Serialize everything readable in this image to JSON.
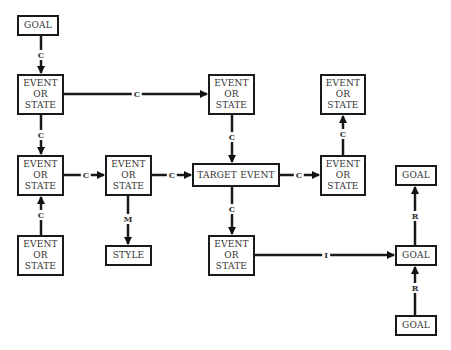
{
  "diagram": {
    "nodes": [
      {
        "id": "goal_top",
        "label": "GOAL",
        "x": 17,
        "y": 15,
        "w": 42,
        "h": 21
      },
      {
        "id": "es_r1_left",
        "label": "EVENT\nOR\nSTATE",
        "x": 17,
        "y": 74,
        "w": 47,
        "h": 41
      },
      {
        "id": "es_r1_mid",
        "label": "EVENT\nOR\nSTATE",
        "x": 208,
        "y": 74,
        "w": 47,
        "h": 41
      },
      {
        "id": "es_r1_right",
        "label": "EVENT\nOR\nSTATE",
        "x": 320,
        "y": 74,
        "w": 46,
        "h": 41
      },
      {
        "id": "es_r2_left",
        "label": "EVENT\nOR\nSTATE",
        "x": 17,
        "y": 155,
        "w": 47,
        "h": 41
      },
      {
        "id": "es_r2_mid",
        "label": "EVENT\nOR\nSTATE",
        "x": 105,
        "y": 155,
        "w": 47,
        "h": 41
      },
      {
        "id": "target_event",
        "label": "TARGET EVENT",
        "x": 192,
        "y": 163,
        "w": 88,
        "h": 24
      },
      {
        "id": "es_r2_right",
        "label": "EVENT\nOR\nSTATE",
        "x": 320,
        "y": 155,
        "w": 46,
        "h": 41
      },
      {
        "id": "goal_r2_right",
        "label": "GOAL",
        "x": 395,
        "y": 165,
        "w": 42,
        "h": 21
      },
      {
        "id": "es_r3_left",
        "label": "EVENT\nOR\nSTATE",
        "x": 17,
        "y": 235,
        "w": 47,
        "h": 41
      },
      {
        "id": "style",
        "label": "STYLE",
        "x": 105,
        "y": 245,
        "w": 47,
        "h": 21
      },
      {
        "id": "es_r3_mid",
        "label": "EVENT\nOR\nSTATE",
        "x": 208,
        "y": 235,
        "w": 47,
        "h": 41
      },
      {
        "id": "goal_r3_right",
        "label": "GOAL",
        "x": 395,
        "y": 245,
        "w": 42,
        "h": 21
      },
      {
        "id": "goal_bottom",
        "label": "GOAL",
        "x": 395,
        "y": 315,
        "w": 42,
        "h": 21
      }
    ],
    "edges": [
      {
        "from": "goal_top",
        "to": "es_r1_left",
        "label": "C",
        "lx": 41,
        "ly": 55
      },
      {
        "from": "es_r1_left",
        "to": "es_r1_mid",
        "label": "C",
        "lx": 137,
        "ly": 94
      },
      {
        "from": "es_r1_left",
        "to": "es_r2_left",
        "label": "C",
        "lx": 41,
        "ly": 135
      },
      {
        "from": "es_r1_mid",
        "to": "target_event",
        "label": "C",
        "lx": 232,
        "ly": 137
      },
      {
        "from": "es_r2_right",
        "to": "es_r1_right",
        "label": "C",
        "lx": 343,
        "ly": 134
      },
      {
        "from": "es_r2_left",
        "to": "es_r2_mid",
        "label": "C",
        "lx": 86,
        "ly": 175
      },
      {
        "from": "es_r2_mid",
        "to": "target_event",
        "label": "C",
        "lx": 172,
        "ly": 175
      },
      {
        "from": "target_event",
        "to": "es_r2_right",
        "label": "C",
        "lx": 299,
        "ly": 175
      },
      {
        "from": "es_r3_left",
        "to": "es_r2_left",
        "label": "C",
        "lx": 41,
        "ly": 215
      },
      {
        "from": "es_r2_mid",
        "to": "style",
        "label": "M",
        "lx": 128,
        "ly": 219
      },
      {
        "from": "target_event",
        "to": "es_r3_mid",
        "label": "C",
        "lx": 232,
        "ly": 209
      },
      {
        "from": "es_r3_mid",
        "to": "goal_r3_right",
        "label": "I",
        "lx": 326,
        "ly": 255
      },
      {
        "from": "goal_r3_right",
        "to": "goal_r2_right",
        "label": "R",
        "lx": 415,
        "ly": 216
      },
      {
        "from": "goal_bottom",
        "to": "goal_r3_right",
        "label": "R",
        "lx": 415,
        "ly": 288
      }
    ]
  }
}
